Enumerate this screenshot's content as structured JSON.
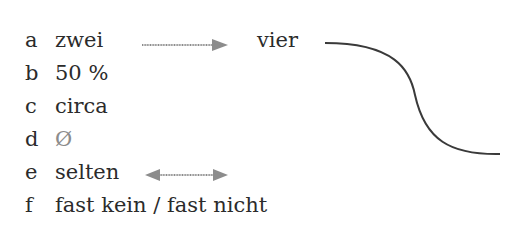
{
  "items": [
    {
      "letter": "a",
      "text": "zwei"
    },
    {
      "letter": "b",
      "text": "50 %"
    },
    {
      "letter": "c",
      "text": "circa"
    },
    {
      "letter": "d",
      "text": "Ø"
    },
    {
      "letter": "e",
      "text": "selten"
    },
    {
      "letter": "f",
      "text": "fast kein / fast nicht"
    }
  ],
  "target_word": "vier",
  "colors": {
    "text": "#2b2b2b",
    "arrow": "#8c8c8c",
    "curve": "#3a3a3a"
  }
}
